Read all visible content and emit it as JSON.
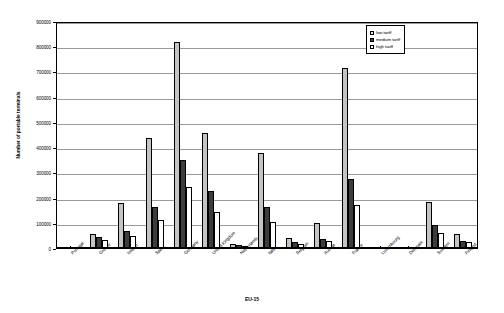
{
  "chart_data": {
    "type": "bar",
    "title": "",
    "xlabel": "EU-15",
    "ylabel": "Number of portable terminals",
    "ylim": [
      0,
      900000
    ],
    "ytick_step": 100000,
    "yticks": [
      "0",
      "100000",
      "200000",
      "300000",
      "400000",
      "500000",
      "600000",
      "700000",
      "800000",
      "900000"
    ],
    "grid": true,
    "legend_position": "top-right",
    "categories": [
      "Portugal",
      "Greece",
      "Ireland",
      "Spain",
      "Germany",
      "United Kingdom",
      "Netherlands",
      "Italy",
      "Belgium",
      "Austria",
      "France",
      "Luxembourg",
      "Denmark",
      "Sweden",
      "Finland"
    ],
    "series": [
      {
        "name": "low tariff",
        "color": "#c4c4c4",
        "values": [
          3000,
          56000,
          178000,
          437000,
          815000,
          455000,
          17000,
          378000,
          41000,
          100000,
          712000,
          0,
          0,
          183000,
          55000
        ]
      },
      {
        "name": "medium tariff",
        "color": "#3c3c3c",
        "values": [
          1000,
          43000,
          68000,
          163000,
          347000,
          227000,
          10000,
          164000,
          22000,
          36000,
          274000,
          0,
          0,
          93000,
          29000
        ]
      },
      {
        "name": "high tariff",
        "color": "#ffffff",
        "values": [
          500,
          33000,
          49000,
          110000,
          240000,
          142000,
          7000,
          103000,
          15000,
          29000,
          169000,
          0,
          0,
          61000,
          24000
        ]
      }
    ]
  },
  "legend": {
    "items": [
      {
        "label": "low tariff"
      },
      {
        "label": "medium tariff"
      },
      {
        "label": "high tariff"
      }
    ]
  }
}
